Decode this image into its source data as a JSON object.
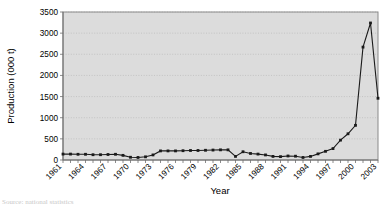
{
  "chart_data": {
    "type": "line",
    "title": "",
    "xlabel": "Year",
    "ylabel": "Production (000 t)",
    "ylim": [
      0,
      3500
    ],
    "ytick_step": 500,
    "yticks": [
      "0",
      "500",
      "1000",
      "1500",
      "2000",
      "2500",
      "3000",
      "3500"
    ],
    "xticks_shown": [
      "1961",
      "1964",
      "1967",
      "1970",
      "1973",
      "1976",
      "1979",
      "1982",
      "1985",
      "1988",
      "1991",
      "1994",
      "1997",
      "2000",
      "2003"
    ],
    "xtick_interval": 3,
    "grid": true,
    "legend": "none",
    "marker": "square",
    "series": [
      {
        "name": "Production",
        "x": [
          1961,
          1962,
          1963,
          1964,
          1965,
          1966,
          1967,
          1968,
          1969,
          1970,
          1971,
          1972,
          1973,
          1974,
          1975,
          1976,
          1977,
          1978,
          1979,
          1980,
          1981,
          1982,
          1983,
          1984,
          1985,
          1986,
          1987,
          1988,
          1989,
          1990,
          1991,
          1992,
          1993,
          1994,
          1995,
          1996,
          1997,
          1998,
          1999,
          2000,
          2001,
          2002,
          2003
        ],
        "values": [
          140,
          140,
          135,
          135,
          125,
          125,
          130,
          135,
          110,
          65,
          60,
          75,
          120,
          215,
          215,
          215,
          220,
          225,
          225,
          230,
          235,
          240,
          240,
          85,
          195,
          155,
          140,
          120,
          85,
          80,
          95,
          90,
          60,
          85,
          145,
          205,
          270,
          470,
          620,
          820,
          2670,
          3240,
          1460
        ]
      }
    ]
  },
  "caption": {
    "partial_text": "Source: national statistics"
  }
}
